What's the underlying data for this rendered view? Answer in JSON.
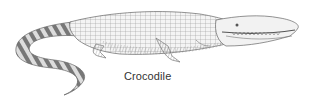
{
  "illustration": {
    "subject": "crocodile",
    "style": "pen-and-ink crosshatch drawing",
    "colors": {
      "ink": "#555555",
      "light": "#aaaaaa",
      "background": "#ffffff"
    }
  },
  "caption": {
    "text": "Crocodile"
  }
}
